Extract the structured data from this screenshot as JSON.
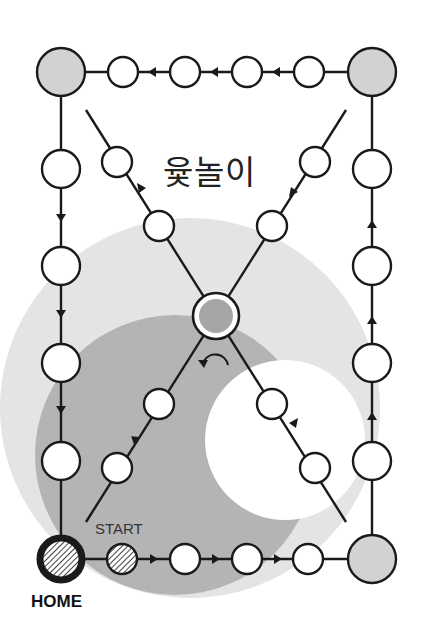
{
  "title": "윷놀이",
  "labels": {
    "start": "START",
    "home": "HOME"
  },
  "colors": {
    "background": "#ffffff",
    "outer_shade": "#e4e4e4",
    "inner_shade": "#b4b4b4",
    "corner_fill": "#d2d2d2",
    "center_fill": "#a6a6a6",
    "stroke": "#1a1a1a"
  },
  "board": {
    "corners": [
      "top-left",
      "top-right",
      "bottom-right",
      "home"
    ],
    "center": "center-station",
    "edge_nodes_per_side": 4,
    "diagonal_nodes_per_arm": 2,
    "direction": "counter-clockwise from START along bottom, up right side, left along top, down left side"
  }
}
